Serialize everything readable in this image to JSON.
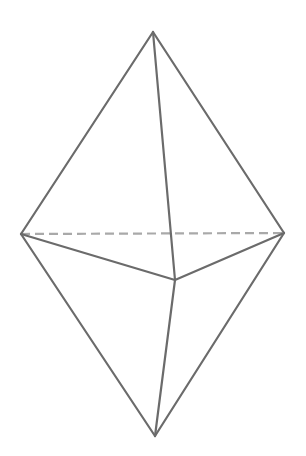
{
  "diagram": {
    "type": "triangular-bipyramid",
    "stroke_color": "#6b6b6b",
    "hidden_edge_color": "#a9a9a9",
    "stroke_width": 2.2,
    "dash_pattern": "9,5",
    "background": "#ffffff",
    "vertices": {
      "top": {
        "x": 153,
        "y": 32
      },
      "left": {
        "x": 21,
        "y": 234
      },
      "right": {
        "x": 284,
        "y": 233
      },
      "front": {
        "x": 175,
        "y": 280
      },
      "bottom": {
        "x": 155,
        "y": 436
      }
    },
    "visible_edges": [
      [
        "top",
        "left"
      ],
      [
        "top",
        "right"
      ],
      [
        "top",
        "front"
      ],
      [
        "left",
        "front"
      ],
      [
        "right",
        "front"
      ],
      [
        "left",
        "bottom"
      ],
      [
        "right",
        "bottom"
      ],
      [
        "front",
        "bottom"
      ]
    ],
    "hidden_edges": [
      [
        "left",
        "right"
      ]
    ]
  }
}
